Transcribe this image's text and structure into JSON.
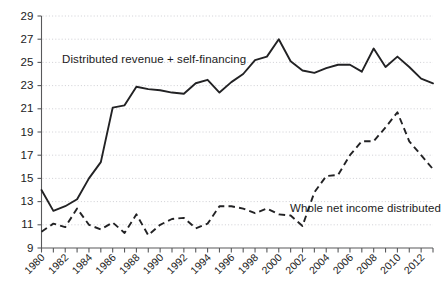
{
  "chart_data": {
    "type": "line",
    "title": "",
    "xlabel": "",
    "ylabel": "",
    "ylim": [
      9,
      29
    ],
    "xlim": [
      1980,
      2013
    ],
    "ytick_step": 2,
    "yticks": [
      9,
      11,
      13,
      15,
      17,
      19,
      21,
      23,
      25,
      27,
      29
    ],
    "xticks_labeled": [
      1980,
      1982,
      1984,
      1986,
      1988,
      1990,
      1992,
      1994,
      1996,
      1998,
      2000,
      2002,
      2004,
      2006,
      2008,
      2010,
      2012
    ],
    "xticks_all": [
      1980,
      1981,
      1982,
      1983,
      1984,
      1985,
      1986,
      1987,
      1988,
      1989,
      1990,
      1991,
      1992,
      1993,
      1994,
      1995,
      1996,
      1997,
      1998,
      1999,
      2000,
      2001,
      2002,
      2003,
      2004,
      2005,
      2006,
      2007,
      2008,
      2009,
      2010,
      2011,
      2012,
      2013
    ],
    "x": [
      1980,
      1981,
      1982,
      1983,
      1984,
      1985,
      1986,
      1987,
      1988,
      1989,
      1990,
      1991,
      1992,
      1993,
      1994,
      1995,
      1996,
      1997,
      1998,
      1999,
      2000,
      2001,
      2002,
      2003,
      2004,
      2005,
      2006,
      2007,
      2008,
      2009,
      2010,
      2011,
      2012,
      2013
    ],
    "grid": true,
    "grid_axis": "y",
    "legend_position": "inline-annotations",
    "series": [
      {
        "name": "Distributed revenue + self-financing",
        "style": "solid",
        "color": "#222224",
        "values": [
          14.0,
          12.2,
          12.6,
          13.2,
          15.0,
          16.4,
          21.1,
          21.3,
          22.9,
          22.7,
          22.6,
          22.4,
          22.3,
          23.2,
          23.5,
          22.4,
          23.3,
          24.0,
          25.2,
          25.5,
          27.0,
          25.1,
          24.3,
          24.1,
          24.5,
          24.8,
          24.8,
          24.2,
          26.2,
          24.6,
          25.5,
          24.6,
          23.6,
          23.2
        ]
      },
      {
        "name": "Whole net income distributed",
        "style": "dashed",
        "color": "#222224",
        "values": [
          10.4,
          11.1,
          10.8,
          12.4,
          11.0,
          10.6,
          11.2,
          10.3,
          11.9,
          10.1,
          11.0,
          11.5,
          11.6,
          10.7,
          11.1,
          12.6,
          12.6,
          12.4,
          12.0,
          12.4,
          11.9,
          11.8,
          10.9,
          13.8,
          15.2,
          15.3,
          17.0,
          18.2,
          18.2,
          19.4,
          20.7,
          18.2,
          17.0,
          15.8
        ]
      }
    ],
    "annotations": [
      {
        "id": "annotation-solid",
        "text": "Distributed revenue + self-financing",
        "x_px": 62,
        "y_px": 63
      },
      {
        "id": "annotation-dashed",
        "text": "Whole net income distributed",
        "x_px": 290,
        "y_px": 212
      }
    ]
  }
}
